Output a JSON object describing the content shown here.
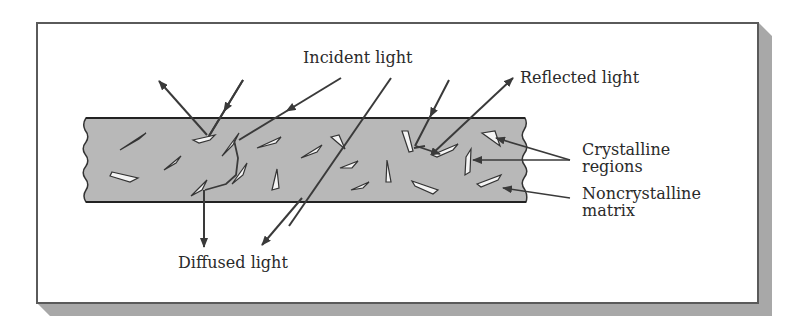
{
  "diagram": {
    "colors": {
      "frame_border": "#5a5a5a",
      "frame_shadow": "#a8a8a8",
      "matrix_fill": "#b8b8b8",
      "crystal_fill": "#f4f4f4",
      "line": "#3a3a3a",
      "text": "#2a2a2a"
    },
    "labels": {
      "incident": "Incident light",
      "reflected": "Reflected light",
      "crystalline_line1": "Crystalline",
      "crystalline_line2": "regions",
      "noncrystalline_line1": "Noncrystalline",
      "noncrystalline_line2": "matrix",
      "diffused": "Diffused light"
    },
    "components": [
      "frame-with-drop-shadow",
      "polymer-slab",
      "crystalline-platelets",
      "incident-light-rays",
      "reflected-light-rays",
      "diffused-light-rays",
      "transmitted-ray"
    ]
  }
}
